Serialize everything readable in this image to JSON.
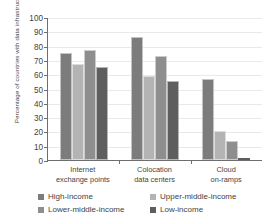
{
  "chart_data": {
    "type": "bar",
    "title": "",
    "xlabel": "",
    "ylabel": "Percentage of countries with data infrastructure",
    "ylim": [
      0,
      100
    ],
    "ytick_step": 10,
    "yticks": [
      100,
      90,
      80,
      70,
      60,
      50,
      40,
      30,
      20,
      10,
      0
    ],
    "grid": true,
    "legend_position": "bottom",
    "categories": [
      "Internet exchange points",
      "Colocation data centers",
      "Cloud on-ramps"
    ],
    "category_lines": [
      [
        "Internet",
        "exchange points"
      ],
      [
        "Colocation",
        "data centers"
      ],
      [
        "Cloud",
        "on-ramps"
      ]
    ],
    "series": [
      {
        "name": "High-income",
        "color": "#7c7c7c",
        "values": [
          75,
          86,
          57
        ]
      },
      {
        "name": "Upper-middle-income",
        "color": "#b4b4b4",
        "values": [
          67,
          59,
          20
        ]
      },
      {
        "name": "Lower-middle-income",
        "color": "#8e8e8e",
        "values": [
          77,
          73,
          13
        ]
      },
      {
        "name": "Low-income",
        "color": "#5e5e5e",
        "values": [
          65,
          55,
          0
        ]
      }
    ]
  },
  "legend": {
    "items": [
      {
        "label": "High-income"
      },
      {
        "label": "Upper-middle-income"
      },
      {
        "label": "Lower-middle-income"
      },
      {
        "label": "Low-income"
      }
    ]
  }
}
